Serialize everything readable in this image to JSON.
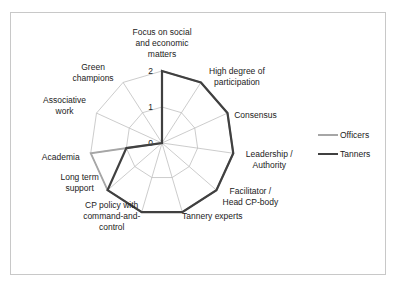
{
  "chart_data": {
    "type": "radar",
    "title": "",
    "categories": [
      "Focus on social and economic matters",
      "High degree of participation",
      "Consensus",
      "Leadership / Authority",
      "Facilitator / Head CP-body",
      "Tannery experts",
      "CP policy with command-and-control",
      "Long term support",
      "Academia",
      "Associative work",
      "Green champions"
    ],
    "category_lines": [
      [
        "Focus on social",
        "and economic",
        "matters"
      ],
      [
        "High degree of",
        "participation"
      ],
      [
        "Consensus"
      ],
      [
        "Leadership /",
        "Authority"
      ],
      [
        "Facilitator /",
        "Head CP-body"
      ],
      [
        "Tannery experts"
      ],
      [
        "CP policy with",
        "command-and-",
        "control"
      ],
      [
        "Long term",
        "support"
      ],
      [
        "Academia"
      ],
      [
        "Associative",
        "work"
      ],
      [
        "Green",
        "champions"
      ]
    ],
    "series": [
      {
        "name": "Officers",
        "color": "#a6a6a6",
        "values": [
          2,
          2,
          2,
          2,
          2,
          2,
          2,
          2,
          2,
          0,
          0
        ]
      },
      {
        "name": "Tanners",
        "color": "#404040",
        "values": [
          2,
          2,
          2,
          2,
          2,
          2,
          2,
          2,
          1,
          0,
          0
        ]
      }
    ],
    "rlim": [
      0,
      2
    ],
    "ticks": [
      "0",
      "1",
      "2"
    ],
    "grid": true,
    "legend_position": "right"
  },
  "legend": {
    "items": [
      {
        "label": "Officers",
        "color": "#a6a6a6"
      },
      {
        "label": "Tanners",
        "color": "#404040"
      }
    ]
  }
}
